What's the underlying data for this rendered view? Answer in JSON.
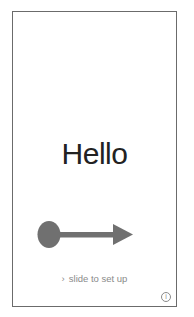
{
  "screen": {
    "greeting": "Hello",
    "slide_hint": {
      "chevron": "›",
      "label": "slide to set up"
    },
    "info_button": {
      "icon": "info-icon",
      "glyph": "i"
    },
    "gesture_annotation": {
      "icon": "swipe-right-arrow-icon",
      "color": "#707070"
    }
  }
}
